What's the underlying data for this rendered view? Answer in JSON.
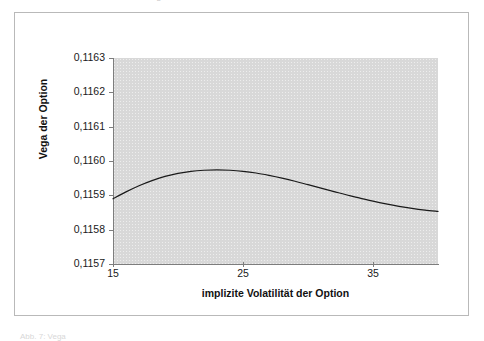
{
  "figure": {
    "top_ghost_text": "Abbildung",
    "bottom_caption_ghost": "Abb. 7: Vega"
  },
  "chart_data": {
    "type": "line",
    "title": "",
    "subtitle": "",
    "xlabel": "implizite Volatilität der Option",
    "ylabel": "Vega der Option",
    "xlim": [
      15,
      40
    ],
    "ylim": [
      0.1157,
      0.1163
    ],
    "x_ticks": [
      15,
      25,
      35
    ],
    "x_tick_labels": [
      "15",
      "25",
      "35"
    ],
    "y_ticks": [
      0.1157,
      0.1158,
      0.1159,
      0.116,
      0.1161,
      0.1162,
      0.1163
    ],
    "y_tick_labels": [
      "0,1157",
      "0,1158",
      "0,1159",
      "0,1160",
      "0,1161",
      "0,1162",
      "0,1163"
    ],
    "grid": false,
    "legend": false,
    "legend_position": "none",
    "plot_background": "#d8d8d8",
    "line_color": "#1a1a1a",
    "line_width": 1.2,
    "series": [
      {
        "name": "Vega der Option",
        "x": [
          15,
          16,
          17,
          18,
          19,
          20,
          21,
          22,
          23,
          24,
          25,
          26,
          27,
          28,
          29,
          30,
          31,
          32,
          33,
          34,
          35,
          36,
          37,
          38,
          39,
          40
        ],
        "values": [
          0.11589,
          0.11591,
          0.115928,
          0.115943,
          0.115955,
          0.115964,
          0.11597,
          0.115973,
          0.115974,
          0.115973,
          0.11597,
          0.115965,
          0.115958,
          0.11595,
          0.115941,
          0.115931,
          0.115921,
          0.115911,
          0.115901,
          0.115892,
          0.115883,
          0.115875,
          0.115868,
          0.115862,
          0.115857,
          0.115853
        ]
      }
    ],
    "annotations": []
  }
}
